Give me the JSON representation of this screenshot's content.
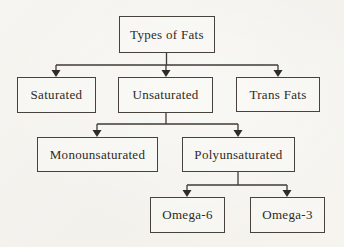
{
  "diagram": {
    "type": "flowchart",
    "title": "Types of Fats",
    "nodes": [
      {
        "id": "types-of-fats",
        "label": "Types of Fats"
      },
      {
        "id": "saturated",
        "label": "Saturated"
      },
      {
        "id": "unsaturated",
        "label": "Unsaturated"
      },
      {
        "id": "trans-fats",
        "label": "Trans Fats"
      },
      {
        "id": "monounsaturated",
        "label": "Monounsaturated"
      },
      {
        "id": "polyunsaturated",
        "label": "Polyunsaturated"
      },
      {
        "id": "omega-6",
        "label": "Omega-6"
      },
      {
        "id": "omega-3",
        "label": "Omega-3"
      }
    ],
    "edges": [
      {
        "from": "types-of-fats",
        "to": "saturated"
      },
      {
        "from": "types-of-fats",
        "to": "unsaturated"
      },
      {
        "from": "types-of-fats",
        "to": "trans-fats"
      },
      {
        "from": "unsaturated",
        "to": "monounsaturated"
      },
      {
        "from": "unsaturated",
        "to": "polyunsaturated"
      },
      {
        "from": "polyunsaturated",
        "to": "omega-6"
      },
      {
        "from": "polyunsaturated",
        "to": "omega-3"
      }
    ],
    "colors": {
      "background": "#f5f4f0",
      "box_border": "#47423b",
      "line": "#3f3a33",
      "text": "#2e2a24"
    }
  }
}
